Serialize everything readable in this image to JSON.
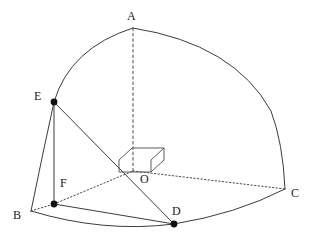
{
  "figure": {
    "kind": "solid-geometry-diagram",
    "width": 314,
    "height": 245,
    "background_color": "#ffffff",
    "stroke_color": "#3c3c3c",
    "point_color": "#111111",
    "label_color": "#1a1a1a",
    "line_width": 1
  },
  "points": [
    {
      "id": "A",
      "label": "A",
      "x": 133,
      "y": 28,
      "label_x": 127,
      "label_y": 10,
      "dot": false
    },
    {
      "id": "B",
      "label": "B",
      "x": 31,
      "y": 211,
      "label_x": 13,
      "label_y": 209,
      "dot": false
    },
    {
      "id": "C",
      "label": "C",
      "x": 285,
      "y": 189,
      "label_x": 291,
      "label_y": 187,
      "dot": false
    },
    {
      "id": "D",
      "label": "D",
      "x": 174,
      "y": 224,
      "label_x": 172,
      "label_y": 205,
      "dot": true
    },
    {
      "id": "E",
      "label": "E",
      "x": 54,
      "y": 102,
      "label_x": 34,
      "label_y": 90,
      "dot": true
    },
    {
      "id": "F",
      "label": "F",
      "x": 54,
      "y": 204,
      "label_x": 60,
      "label_y": 177,
      "dot": true
    },
    {
      "id": "O",
      "label": "O",
      "x": 133,
      "y": 171,
      "label_x": 140,
      "label_y": 173,
      "dot": false
    }
  ],
  "arcs": [
    {
      "id": "arc-A-E-B",
      "from": "A",
      "to": "B",
      "style": "solid",
      "note": "great-circle arc A to B passing through E"
    },
    {
      "id": "arc-A-C",
      "from": "A",
      "to": "C",
      "style": "solid",
      "note": "great-circle arc A to C"
    },
    {
      "id": "arc-B-D-C",
      "from": "B",
      "to": "C",
      "style": "solid",
      "note": "base arc B to C passing through D"
    }
  ],
  "segments": [
    {
      "id": "seg-E-F",
      "from": "E",
      "to": "F",
      "style": "solid",
      "note": "vertical segment EF"
    },
    {
      "id": "seg-E-D",
      "from": "E",
      "to": "D",
      "style": "solid",
      "note": "segment ED crossing near O"
    },
    {
      "id": "seg-F-D",
      "from": "F",
      "to": "D",
      "style": "solid",
      "note": "segment FD"
    },
    {
      "id": "seg-B-F",
      "from": "B",
      "to": "F",
      "style": "dotted",
      "note": "hidden edge B to F"
    },
    {
      "id": "seg-F-O",
      "from": "F",
      "to": "O",
      "style": "dotted",
      "note": "hidden edge F to O (continues B-F-O)"
    },
    {
      "id": "seg-O-C",
      "from": "O",
      "to": "C",
      "style": "dotted",
      "note": "hidden radius O to C"
    },
    {
      "id": "seg-O-A",
      "from": "O",
      "to": "A",
      "style": "dashed",
      "note": "vertical axis O to A"
    },
    {
      "id": "seg-O-D",
      "from": "O",
      "to": "D",
      "style": "solid",
      "note": "radius O to D along ED"
    }
  ],
  "right_angle_marker": {
    "id": "right-angle-box-at-O",
    "note": "small 3-D box drawn at O indicating the mutually perpendicular axes",
    "vertex": "O",
    "front_face": "119,160 119,172 151,172 151,160",
    "top_offset_x": 13,
    "top_offset_y": -12
  },
  "labels": {
    "A": "A",
    "B": "B",
    "C": "C",
    "D": "D",
    "E": "E",
    "F": "F",
    "O": "O"
  }
}
